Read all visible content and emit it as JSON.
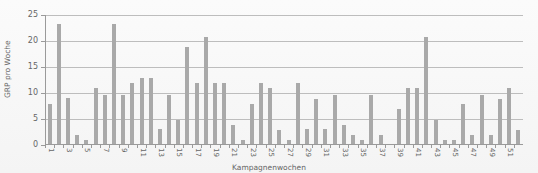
{
  "chart_data": {
    "type": "bar",
    "title": "",
    "xlabel": "Kampagnenwochen",
    "ylabel": "GRP pro Woche",
    "ylim": [
      0,
      25
    ],
    "yticks": [
      0,
      5,
      10,
      15,
      20,
      25
    ],
    "grid": true,
    "legend": null,
    "bar_color": "#a9a9a9",
    "categories": [
      "1",
      "2",
      "3",
      "4",
      "5",
      "6",
      "7",
      "8",
      "9",
      "10",
      "11",
      "12",
      "13",
      "14",
      "15",
      "16",
      "17",
      "18",
      "19",
      "20",
      "21",
      "22",
      "23",
      "24",
      "25",
      "26",
      "27",
      "28",
      "29",
      "30",
      "31",
      "32",
      "33",
      "34",
      "35",
      "36",
      "37",
      "38",
      "39",
      "40",
      "41",
      "42",
      "43",
      "44",
      "45",
      "46",
      "47",
      "48",
      "49",
      "50",
      "51",
      "52"
    ],
    "x_tick_labels_shown": [
      "1",
      "3",
      "5",
      "7",
      "9",
      "11",
      "13",
      "15",
      "17",
      "19",
      "21",
      "23",
      "25",
      "27",
      "29",
      "31",
      "33",
      "35",
      "37",
      "39",
      "41",
      "43",
      "45",
      "47",
      "49",
      "51"
    ],
    "values": [
      7.8,
      23.3,
      9,
      2,
      1,
      11,
      9.7,
      23.3,
      9.7,
      11.9,
      12.9,
      12.9,
      3,
      9.7,
      4.8,
      18.8,
      11.9,
      20.7,
      11.9,
      11.9,
      3.8,
      1,
      7.8,
      11.9,
      10.9,
      2.9,
      1,
      11.9,
      3,
      8.8,
      3,
      9.7,
      3.8,
      1.9,
      1,
      9.7,
      1.9,
      0,
      6.9,
      10.9,
      10.9,
      20.7,
      4.8,
      1,
      1,
      7.8,
      1.9,
      9.7,
      1.9,
      8.9,
      10.9,
      2.9
    ]
  }
}
